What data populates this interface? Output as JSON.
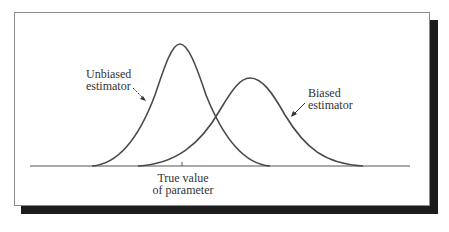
{
  "diagram": {
    "title": "",
    "labels": {
      "unbiased_line1": "Unbiased",
      "unbiased_line2": "estimator",
      "biased_line1": "Biased",
      "biased_line2": "estimator",
      "axis_line1": "True value",
      "axis_line2": "of parameter"
    },
    "colors": {
      "curve": "#4a4a4a",
      "shadow": "#1c1c1c",
      "frame": "#8a8a8a"
    },
    "curves": [
      {
        "name": "Unbiased estimator",
        "center_x": 180,
        "peak_y": 44,
        "left_foot_x": 92,
        "right_foot_x": 270
      },
      {
        "name": "Biased estimator",
        "center_x": 250,
        "peak_y": 78,
        "left_foot_x": 138,
        "right_foot_x": 363
      }
    ]
  }
}
